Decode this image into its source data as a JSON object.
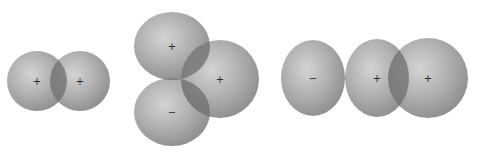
{
  "diagram": {
    "background": "#ffffff",
    "colors": {
      "lobe_fill_light": "#d6d6d6",
      "lobe_fill_mid": "#a9a9a9",
      "lobe_fill_dark": "#8c8c8c",
      "overlap": "#6e6e6e"
    },
    "groups": [
      {
        "name": "s-s overlap",
        "lobes": [
          {
            "cx": 37,
            "cy": 81,
            "rx": 30,
            "ry": 30,
            "sign": "+"
          },
          {
            "cx": 80,
            "cy": 81,
            "rx": 30,
            "ry": 30,
            "sign": "+"
          }
        ]
      },
      {
        "name": "s-p side overlap",
        "lobes": [
          {
            "cx": 172,
            "cy": 46,
            "rx": 38,
            "ry": 34,
            "sign": "+"
          },
          {
            "cx": 172,
            "cy": 112,
            "rx": 38,
            "ry": 34,
            "sign": "−"
          },
          {
            "cx": 220,
            "cy": 79,
            "rx": 39,
            "ry": 39,
            "sign": "+"
          }
        ]
      },
      {
        "name": "p-s end overlap",
        "lobes": [
          {
            "cx": 313,
            "cy": 78,
            "rx": 32,
            "ry": 38,
            "sign": "−"
          },
          {
            "cx": 377,
            "cy": 78,
            "rx": 32,
            "ry": 39,
            "sign": "+"
          },
          {
            "cx": 428,
            "cy": 78,
            "rx": 40,
            "ry": 40,
            "sign": "+"
          }
        ]
      }
    ]
  }
}
